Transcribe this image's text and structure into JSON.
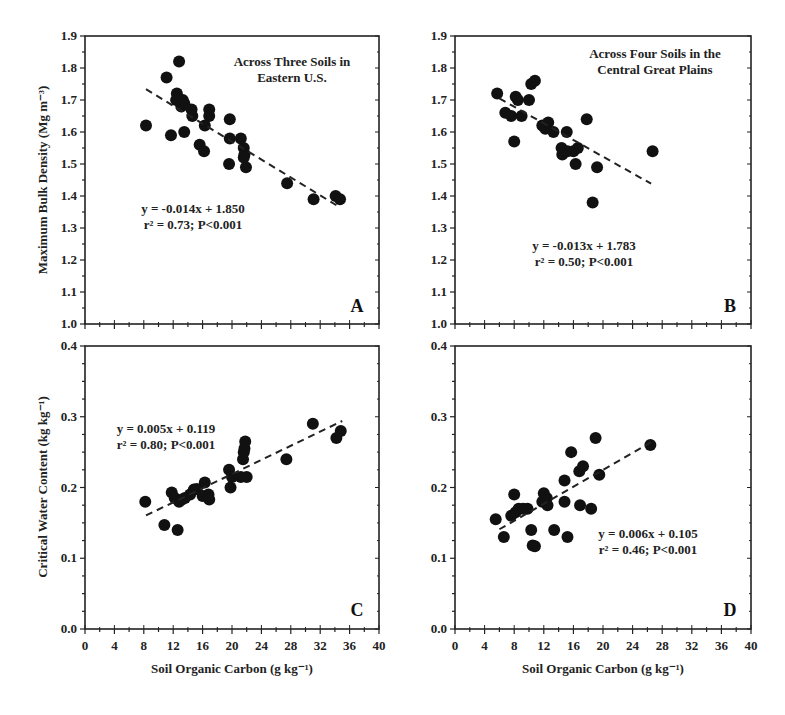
{
  "figure": {
    "y_label_top": "Maximum Bulk Density (Mg m⁻³)",
    "y_label_bottom": "Critical Water Content (kg kg⁻¹)",
    "x_label": "Soil Organic Carbon (g kg⁻¹)",
    "x_ticks": [
      "0",
      "4",
      "8",
      "12",
      "16",
      "20",
      "24",
      "28",
      "32",
      "36",
      "40"
    ],
    "y_ticks_top": [
      "1.0",
      "1.1",
      "1.2",
      "1.3",
      "1.4",
      "1.5",
      "1.6",
      "1.7",
      "1.8",
      "1.9"
    ],
    "y_ticks_bottom": [
      "0.0",
      "0.1",
      "0.2",
      "0.3",
      "0.4"
    ]
  },
  "chart_data": [
    {
      "panel": "A",
      "type": "scatter",
      "title": "Across Three Soils in Eastern U.S.",
      "title_lines": [
        "Across Three Soils in",
        "Eastern U.S."
      ],
      "xlabel": "Soil Organic Carbon (g kg⁻¹)",
      "ylabel": "Maximum Bulk Density (Mg m⁻³)",
      "xlim": [
        0,
        40
      ],
      "ylim": [
        1.0,
        1.9
      ],
      "equation": "y = -0.014x + 1.850",
      "stats": "r² = 0.73; P<0.001",
      "fit": {
        "slope": -0.014,
        "intercept": 1.85,
        "x_range": [
          8.3,
          34.7
        ]
      },
      "points": [
        [
          8.3,
          1.62
        ],
        [
          11.1,
          1.77
        ],
        [
          12.8,
          1.82
        ],
        [
          12.5,
          1.72
        ],
        [
          12.4,
          1.7
        ],
        [
          13.1,
          1.68
        ],
        [
          13.3,
          1.7
        ],
        [
          13.5,
          1.69
        ],
        [
          14.5,
          1.67
        ],
        [
          14.6,
          1.65
        ],
        [
          11.7,
          1.59
        ],
        [
          13.5,
          1.6
        ],
        [
          15.6,
          1.56
        ],
        [
          16.2,
          1.54
        ],
        [
          16.3,
          1.62
        ],
        [
          16.9,
          1.67
        ],
        [
          16.9,
          1.65
        ],
        [
          19.7,
          1.64
        ],
        [
          19.7,
          1.58
        ],
        [
          19.6,
          1.5
        ],
        [
          21.2,
          1.58
        ],
        [
          21.6,
          1.55
        ],
        [
          21.7,
          1.53
        ],
        [
          21.6,
          1.52
        ],
        [
          21.9,
          1.49
        ],
        [
          27.5,
          1.44
        ],
        [
          31.1,
          1.39
        ],
        [
          34.1,
          1.4
        ],
        [
          34.7,
          1.39
        ]
      ]
    },
    {
      "panel": "B",
      "type": "scatter",
      "title": "Across Four Soils in the Central Great Plains",
      "title_lines": [
        "Across Four Soils in the",
        "Central Great Plains"
      ],
      "xlabel": "",
      "ylabel": "",
      "xlim": [
        0,
        40
      ],
      "ylim": [
        1.0,
        1.9
      ],
      "equation": "y = -0.013x + 1.783",
      "stats": "r² = 0.50; P<0.001",
      "fit": {
        "slope": -0.013,
        "intercept": 1.783,
        "x_range": [
          6.0,
          26.5
        ]
      },
      "points": [
        [
          5.7,
          1.72
        ],
        [
          6.8,
          1.66
        ],
        [
          7.6,
          1.65
        ],
        [
          8.2,
          1.71
        ],
        [
          8.5,
          1.7
        ],
        [
          9.0,
          1.65
        ],
        [
          10.0,
          1.7
        ],
        [
          10.3,
          1.75
        ],
        [
          10.8,
          1.76
        ],
        [
          8.0,
          1.57
        ],
        [
          11.8,
          1.62
        ],
        [
          12.2,
          1.61
        ],
        [
          12.6,
          1.63
        ],
        [
          13.3,
          1.6
        ],
        [
          15.1,
          1.6
        ],
        [
          14.4,
          1.55
        ],
        [
          14.5,
          1.53
        ],
        [
          15.2,
          1.54
        ],
        [
          16.0,
          1.54
        ],
        [
          16.6,
          1.55
        ],
        [
          16.3,
          1.5
        ],
        [
          17.8,
          1.64
        ],
        [
          19.2,
          1.49
        ],
        [
          18.6,
          1.38
        ],
        [
          26.7,
          1.54
        ]
      ]
    },
    {
      "panel": "C",
      "type": "scatter",
      "title": "",
      "xlabel": "Soil Organic Carbon (g kg⁻¹)",
      "ylabel": "Critical Water Content (kg kg⁻¹)",
      "xlim": [
        0,
        40
      ],
      "ylim": [
        0.0,
        0.4
      ],
      "equation": "y = 0.005x + 0.119",
      "stats": "r² = 0.80; P<0.001",
      "fit": {
        "slope": 0.005,
        "intercept": 0.119,
        "x_range": [
          8.3,
          35.0
        ]
      },
      "points": [
        [
          8.2,
          0.18
        ],
        [
          10.8,
          0.147
        ],
        [
          11.8,
          0.193
        ],
        [
          12.2,
          0.185
        ],
        [
          12.6,
          0.14
        ],
        [
          12.8,
          0.18
        ],
        [
          13.2,
          0.183
        ],
        [
          13.6,
          0.185
        ],
        [
          14.3,
          0.19
        ],
        [
          14.8,
          0.197
        ],
        [
          15.2,
          0.198
        ],
        [
          16.0,
          0.188
        ],
        [
          16.3,
          0.207
        ],
        [
          16.8,
          0.19
        ],
        [
          16.9,
          0.183
        ],
        [
          19.6,
          0.225
        ],
        [
          19.8,
          0.2
        ],
        [
          20.0,
          0.215
        ],
        [
          21.2,
          0.215
        ],
        [
          21.5,
          0.24
        ],
        [
          21.6,
          0.25
        ],
        [
          21.7,
          0.255
        ],
        [
          21.8,
          0.265
        ],
        [
          22.0,
          0.215
        ],
        [
          27.4,
          0.24
        ],
        [
          31.0,
          0.29
        ],
        [
          34.2,
          0.27
        ],
        [
          34.8,
          0.28
        ]
      ]
    },
    {
      "panel": "D",
      "type": "scatter",
      "title": "",
      "xlabel": "Soil Organic Carbon (g kg⁻¹)",
      "ylabel": "",
      "xlim": [
        0,
        40
      ],
      "ylim": [
        0.0,
        0.4
      ],
      "equation": "y = 0.006x + 0.105",
      "stats": "r² = 0.46; P<0.001",
      "fit": {
        "slope": 0.006,
        "intercept": 0.105,
        "x_range": [
          6.0,
          26.5
        ]
      },
      "points": [
        [
          5.5,
          0.155
        ],
        [
          6.6,
          0.13
        ],
        [
          7.6,
          0.16
        ],
        [
          8.0,
          0.19
        ],
        [
          8.2,
          0.165
        ],
        [
          8.6,
          0.17
        ],
        [
          9.2,
          0.17
        ],
        [
          9.8,
          0.17
        ],
        [
          10.3,
          0.14
        ],
        [
          10.5,
          0.118
        ],
        [
          10.8,
          0.117
        ],
        [
          11.8,
          0.18
        ],
        [
          12.0,
          0.192
        ],
        [
          12.4,
          0.185
        ],
        [
          12.5,
          0.175
        ],
        [
          13.4,
          0.14
        ],
        [
          14.8,
          0.21
        ],
        [
          14.8,
          0.18
        ],
        [
          15.2,
          0.13
        ],
        [
          15.7,
          0.25
        ],
        [
          16.8,
          0.223
        ],
        [
          17.3,
          0.23
        ],
        [
          16.9,
          0.175
        ],
        [
          18.4,
          0.17
        ],
        [
          19.0,
          0.27
        ],
        [
          19.5,
          0.218
        ],
        [
          26.4,
          0.26
        ]
      ]
    }
  ]
}
